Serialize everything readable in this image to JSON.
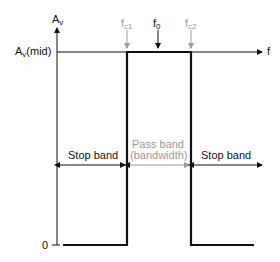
{
  "diagram": {
    "type": "ideal-band-pass-response",
    "y_axis": {
      "label": "A",
      "label_sub": "v"
    },
    "x_axis": {
      "label": "f"
    },
    "levels": {
      "mid_label": "A",
      "mid_sub": "v",
      "mid_suffix": "(mid)",
      "zero_label": "0"
    },
    "markers": [
      {
        "label": "f",
        "sub": "c1",
        "color": "#999999"
      },
      {
        "label": "f",
        "sub": "0",
        "color": "#111111"
      },
      {
        "label": "f",
        "sub": "c2",
        "color": "#999999"
      }
    ],
    "regions": {
      "left": "Stop band",
      "middle_line1": "Pass band",
      "middle_line2": "(bandwidth)",
      "right": "Stop band"
    },
    "colors": {
      "line": "#111111",
      "muted": "#999999"
    }
  }
}
